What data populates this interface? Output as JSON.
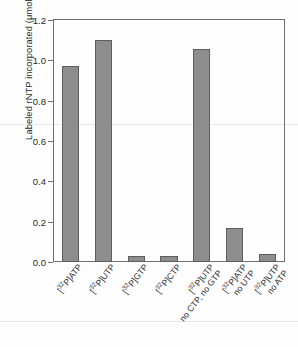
{
  "chart_data": {
    "type": "bar",
    "title": "",
    "xlabel": "",
    "ylabel": "Labeled rNTP incorporated (μmol)",
    "ylim": [
      0,
      1.2
    ],
    "yticks": [
      "0.0",
      "0.2",
      "0.4",
      "0.6",
      "0.8",
      "1.0",
      "1.2"
    ],
    "ytick_values": [
      0.0,
      0.2,
      0.4,
      0.6,
      0.8,
      1.0,
      1.2
    ],
    "grid": false,
    "legend": "none",
    "bar_color": "#8d8d8d",
    "bar_edge_color": "#5d5d5d",
    "axis_color": "#6f6f6f",
    "categories": [
      {
        "line1_pre": "[",
        "line1_sup": "32",
        "line1_post": "P]ATP",
        "line2": ""
      },
      {
        "line1_pre": "[",
        "line1_sup": "32",
        "line1_post": "P]UTP",
        "line2": ""
      },
      {
        "line1_pre": "[",
        "line1_sup": "32",
        "line1_post": "P]GTP",
        "line2": ""
      },
      {
        "line1_pre": "[",
        "line1_sup": "32",
        "line1_post": "P]CTP",
        "line2": ""
      },
      {
        "line1_pre": "[",
        "line1_sup": "32",
        "line1_post": "P]UTP",
        "line2": "no CTP, no GTP"
      },
      {
        "line1_pre": "[",
        "line1_sup": "32",
        "line1_post": "P]ATP",
        "line2": "no UTP"
      },
      {
        "line1_pre": "[",
        "line1_sup": "32",
        "line1_post": "P]UTP",
        "line2": "no ATP"
      }
    ],
    "categories_text": [
      "[32P]ATP",
      "[32P]UTP",
      "[32P]GTP",
      "[32P]CTP",
      "[32P]UTP no CTP, no GTP",
      "[32P]ATP no UTP",
      "[32P]UTP no ATP"
    ],
    "values": [
      0.97,
      1.1,
      0.03,
      0.03,
      1.055,
      0.17,
      0.04
    ]
  }
}
